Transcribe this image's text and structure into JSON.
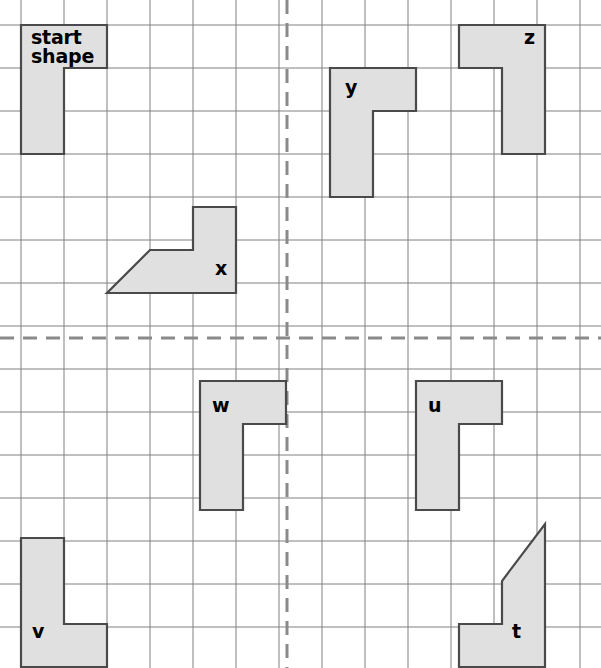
{
  "page": {
    "width": 601,
    "height": 668,
    "background": "#ffffff"
  },
  "grid": {
    "cell_size": 43,
    "origin_x": 21,
    "origin_y": 25,
    "line_color": "#808080",
    "line_width": 1,
    "columns": 14,
    "rows": 16,
    "axis": {
      "color": "#8a8a8a",
      "width": 3,
      "dash": "14,9",
      "vertical_x": 287,
      "horizontal_y": 338,
      "vertical_label": "mirror-line-vertical",
      "horizontal_label": "mirror-line-horizontal"
    }
  },
  "shape_style": {
    "fill": "#e0e0e0",
    "stroke": "#4a4a4a",
    "stroke_width": 2.2
  },
  "shapes": [
    {
      "id": "start",
      "label": "start\nshape",
      "name": "start-shape",
      "orientation": "original",
      "label_x": 31,
      "label_y": 28,
      "points": "21,25 107,25 107,68 64,68 64,154 21,154"
    },
    {
      "id": "y",
      "label": "y",
      "name": "shape-y",
      "orientation": "original",
      "label_x": 345,
      "label_y": 78,
      "points": "330,68 416,68 416,111 373,111 373,197 330,197"
    },
    {
      "id": "z",
      "label": "z",
      "name": "shape-z",
      "orientation": "reflected-horizontal",
      "label_x": 524,
      "label_y": 28,
      "points": "545,25 459,25 459,68 502,68 502,154 545,154"
    },
    {
      "id": "x",
      "label": "x",
      "name": "shape-x",
      "orientation": "rotated-90",
      "label_x": 215,
      "label_y": 259,
      "points": "193,207 236,207 236,293 107,293 150,250 193,250"
    },
    {
      "id": "w",
      "label": "w",
      "name": "shape-w",
      "orientation": "original",
      "label_x": 212,
      "label_y": 396,
      "points": "200,381 286,381 286,424 243,424 243,510 200,510"
    },
    {
      "id": "u",
      "label": "u",
      "name": "shape-u",
      "orientation": "original",
      "label_x": 428,
      "label_y": 396,
      "points": "416,381 502,381 502,424 459,424 459,510 416,510"
    },
    {
      "id": "v",
      "label": "v",
      "name": "shape-v",
      "orientation": "reflected-vertical",
      "label_x": 32,
      "label_y": 622,
      "points": "21,538 64,538 64,624 107,624 107,667 21,667"
    },
    {
      "id": "t",
      "label": "t",
      "name": "shape-t",
      "orientation": "rotated-180",
      "label_x": 512,
      "label_y": 622,
      "points": "545,524 545,667 459,667 459,624 502,624 502,581"
    }
  ]
}
